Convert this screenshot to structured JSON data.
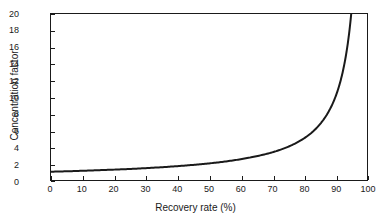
{
  "chart_data": {
    "type": "line",
    "title": "",
    "xlabel": "Recovery rate (%)",
    "ylabel": "Concentration factor",
    "xlim": [
      0,
      100
    ],
    "ylim": [
      0,
      20
    ],
    "grid": false,
    "legend": null,
    "x_ticks": [
      "0",
      "10",
      "20",
      "30",
      "40",
      "50",
      "60",
      "70",
      "80",
      "90",
      "100"
    ],
    "y_ticks": [
      "0",
      "2",
      "4",
      "6",
      "8",
      "10",
      "12",
      "14",
      "16",
      "18",
      "20"
    ],
    "series": [
      {
        "name": "Concentration factor",
        "color": "#1a1a1a",
        "line_width": 2,
        "relation": "CF = 1 / (1 - R/100)",
        "x": [
          0,
          5,
          10,
          15,
          20,
          25,
          30,
          35,
          40,
          45,
          50,
          55,
          60,
          65,
          70,
          75,
          80,
          82.5,
          85,
          87.5,
          90,
          91,
          92,
          93,
          94,
          95
        ],
        "values": [
          1.0,
          1.05,
          1.11,
          1.18,
          1.25,
          1.33,
          1.43,
          1.54,
          1.67,
          1.82,
          2.0,
          2.22,
          2.5,
          2.86,
          3.33,
          4.0,
          5.0,
          5.71,
          6.67,
          8.0,
          10.0,
          11.11,
          12.5,
          14.29,
          16.67,
          20.0
        ]
      }
    ]
  }
}
